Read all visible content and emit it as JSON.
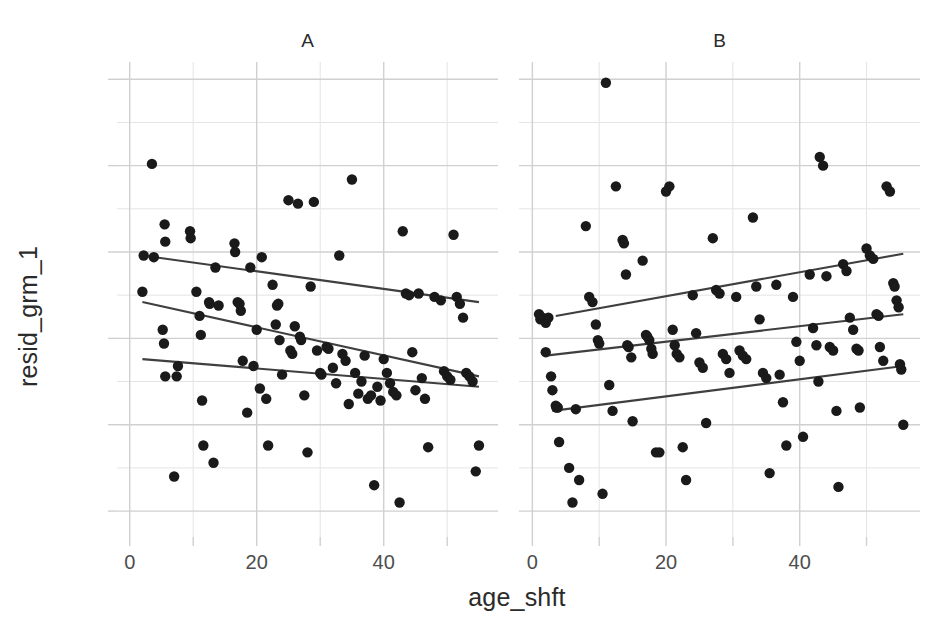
{
  "chart_data": {
    "type": "scatter",
    "title": "",
    "xlabel": "age_shft",
    "ylabel": "resid_grm_1",
    "xlim": [
      -2,
      58
    ],
    "ylim": [
      -115,
      160
    ],
    "grid": true,
    "legend_position": "none",
    "x_major_ticks": [
      0,
      20,
      40
    ],
    "x_major_tick_labels": [
      "0",
      "20",
      "40"
    ],
    "x_minor_ticks": [
      10,
      30,
      50
    ],
    "y_major_ticks": [
      -100,
      -50,
      0,
      50,
      100,
      150
    ],
    "y_major_tick_labels": [
      "-100",
      "-50",
      "0",
      "50",
      "100",
      "150"
    ],
    "y_minor_ticks": [
      -75,
      -25,
      25,
      75,
      125
    ],
    "panels": [
      {
        "label": "A",
        "points": [
          [
            3.5,
            101
          ],
          [
            2.2,
            48
          ],
          [
            3.8,
            47
          ],
          [
            2.0,
            27
          ],
          [
            5.5,
            66
          ],
          [
            5.6,
            56
          ],
          [
            5.2,
            5
          ],
          [
            5.4,
            -3
          ],
          [
            5.6,
            -22
          ],
          [
            7.0,
            -80
          ],
          [
            7.4,
            -22
          ],
          [
            7.6,
            -16
          ],
          [
            9.5,
            62
          ],
          [
            9.6,
            58
          ],
          [
            10.5,
            27
          ],
          [
            11.0,
            13
          ],
          [
            11.2,
            2
          ],
          [
            11.4,
            -36
          ],
          [
            11.6,
            -62
          ],
          [
            12.5,
            21
          ],
          [
            12.6,
            20
          ],
          [
            13.2,
            -72
          ],
          [
            13.5,
            41
          ],
          [
            14.0,
            19
          ],
          [
            16.5,
            55
          ],
          [
            16.6,
            50
          ],
          [
            17.0,
            21
          ],
          [
            17.3,
            20
          ],
          [
            17.5,
            16
          ],
          [
            17.8,
            -13
          ],
          [
            18.5,
            -43
          ],
          [
            19.0,
            41
          ],
          [
            19.5,
            -16
          ],
          [
            20.0,
            5
          ],
          [
            20.5,
            -29
          ],
          [
            20.8,
            47
          ],
          [
            21.5,
            -35
          ],
          [
            21.8,
            -62
          ],
          [
            22.5,
            31
          ],
          [
            23.0,
            8
          ],
          [
            23.2,
            19
          ],
          [
            23.4,
            20
          ],
          [
            23.6,
            -1
          ],
          [
            24.0,
            -21
          ],
          [
            25.0,
            80
          ],
          [
            25.3,
            -7
          ],
          [
            25.6,
            -9
          ],
          [
            26.0,
            7
          ],
          [
            26.5,
            78
          ],
          [
            26.8,
            1
          ],
          [
            27.0,
            -1
          ],
          [
            27.5,
            -33
          ],
          [
            28.0,
            -66
          ],
          [
            28.5,
            30
          ],
          [
            29.0,
            79
          ],
          [
            29.5,
            -7
          ],
          [
            30.0,
            -20
          ],
          [
            30.2,
            -21
          ],
          [
            31.0,
            -5
          ],
          [
            31.3,
            -6
          ],
          [
            32.0,
            -17
          ],
          [
            32.5,
            -26
          ],
          [
            33.0,
            48
          ],
          [
            33.5,
            -9
          ],
          [
            34.0,
            -13
          ],
          [
            34.5,
            -38
          ],
          [
            35.0,
            92
          ],
          [
            35.5,
            -20
          ],
          [
            36.0,
            -32
          ],
          [
            36.5,
            -25
          ],
          [
            37.0,
            -10
          ],
          [
            37.5,
            -35
          ],
          [
            38.0,
            -33
          ],
          [
            38.5,
            -85
          ],
          [
            39.0,
            -28
          ],
          [
            39.5,
            -36
          ],
          [
            40.0,
            -12
          ],
          [
            40.5,
            -20
          ],
          [
            41.0,
            -26
          ],
          [
            41.5,
            -31
          ],
          [
            42.0,
            -33
          ],
          [
            42.5,
            -95
          ],
          [
            43.0,
            62
          ],
          [
            43.5,
            26
          ],
          [
            44.0,
            25
          ],
          [
            44.5,
            -8
          ],
          [
            45.0,
            -30
          ],
          [
            45.5,
            26
          ],
          [
            46.0,
            -23
          ],
          [
            46.5,
            -35
          ],
          [
            47.0,
            -63
          ],
          [
            48.0,
            24
          ],
          [
            49.0,
            22
          ],
          [
            49.5,
            -19
          ],
          [
            50.0,
            -22
          ],
          [
            50.5,
            -24
          ],
          [
            51.0,
            60
          ],
          [
            51.5,
            24
          ],
          [
            52.0,
            20
          ],
          [
            52.5,
            12
          ],
          [
            53.0,
            -20
          ],
          [
            53.5,
            -22
          ],
          [
            54.0,
            -25
          ],
          [
            54.5,
            -77
          ],
          [
            55.0,
            -62
          ]
        ],
        "fit_lines": [
          {
            "quantile": "upper",
            "x0": 2.0,
            "y0": 48,
            "x1": 55.0,
            "y1": 21
          },
          {
            "quantile": "median",
            "x0": 2.0,
            "y0": 21,
            "x1": 55.0,
            "y1": -22
          },
          {
            "quantile": "lower",
            "x0": 2.0,
            "y0": -12,
            "x1": 55.0,
            "y1": -28
          }
        ]
      },
      {
        "label": "B",
        "points": [
          [
            1.0,
            14
          ],
          [
            1.2,
            11
          ],
          [
            1.5,
            12
          ],
          [
            2.0,
            9
          ],
          [
            2.4,
            12
          ],
          [
            2.0,
            -8
          ],
          [
            2.8,
            -22
          ],
          [
            3.0,
            -30
          ],
          [
            3.5,
            -39
          ],
          [
            3.6,
            -40
          ],
          [
            3.8,
            -40
          ],
          [
            4.0,
            -60
          ],
          [
            5.5,
            -75
          ],
          [
            6.0,
            -95
          ],
          [
            6.5,
            -41
          ],
          [
            7.0,
            -82
          ],
          [
            8.0,
            65
          ],
          [
            8.5,
            24
          ],
          [
            9.0,
            21
          ],
          [
            9.5,
            8
          ],
          [
            9.8,
            -1
          ],
          [
            10.0,
            -3
          ],
          [
            10.5,
            -90
          ],
          [
            11.0,
            148
          ],
          [
            11.5,
            -27
          ],
          [
            12.0,
            -42
          ],
          [
            12.5,
            88
          ],
          [
            13.5,
            57
          ],
          [
            13.7,
            55
          ],
          [
            14.0,
            37
          ],
          [
            14.2,
            -4
          ],
          [
            14.4,
            -5
          ],
          [
            14.8,
            -11
          ],
          [
            15.0,
            -48
          ],
          [
            16.5,
            45
          ],
          [
            17.0,
            2
          ],
          [
            17.2,
            1
          ],
          [
            17.5,
            -1
          ],
          [
            17.8,
            -6
          ],
          [
            18.0,
            -9
          ],
          [
            18.5,
            -66
          ],
          [
            19.0,
            -66
          ],
          [
            20.0,
            85
          ],
          [
            20.5,
            88
          ],
          [
            21.0,
            5
          ],
          [
            21.3,
            -4
          ],
          [
            21.6,
            -9
          ],
          [
            22.0,
            -11
          ],
          [
            22.5,
            -63
          ],
          [
            23.0,
            -82
          ],
          [
            24.0,
            25
          ],
          [
            24.5,
            3
          ],
          [
            25.0,
            -14
          ],
          [
            25.5,
            -17
          ],
          [
            26.0,
            -49
          ],
          [
            27.0,
            58
          ],
          [
            27.5,
            28
          ],
          [
            28.0,
            26
          ],
          [
            28.5,
            -9
          ],
          [
            29.0,
            -12
          ],
          [
            29.5,
            -20
          ],
          [
            30.5,
            24
          ],
          [
            31.0,
            -7
          ],
          [
            31.5,
            -10
          ],
          [
            32.0,
            -12
          ],
          [
            33.0,
            70
          ],
          [
            33.5,
            30
          ],
          [
            34.0,
            11
          ],
          [
            34.5,
            -20
          ],
          [
            35.0,
            -23
          ],
          [
            35.5,
            -78
          ],
          [
            36.5,
            31
          ],
          [
            37.0,
            -21
          ],
          [
            37.5,
            -37
          ],
          [
            38.0,
            -62
          ],
          [
            39.0,
            24
          ],
          [
            39.5,
            -2
          ],
          [
            40.0,
            -13
          ],
          [
            40.5,
            -57
          ],
          [
            41.5,
            37
          ],
          [
            42.0,
            6
          ],
          [
            42.5,
            -4
          ],
          [
            42.8,
            -25
          ],
          [
            43.0,
            105
          ],
          [
            43.5,
            100
          ],
          [
            44.0,
            36
          ],
          [
            44.5,
            -5
          ],
          [
            45.0,
            -7
          ],
          [
            45.5,
            -42
          ],
          [
            45.8,
            -86
          ],
          [
            46.5,
            43
          ],
          [
            47.0,
            39
          ],
          [
            47.5,
            12
          ],
          [
            48.0,
            5
          ],
          [
            48.5,
            -6
          ],
          [
            48.8,
            -7
          ],
          [
            49.0,
            -40
          ],
          [
            50.0,
            52
          ],
          [
            50.5,
            48
          ],
          [
            51.0,
            46
          ],
          [
            51.5,
            14
          ],
          [
            51.8,
            13
          ],
          [
            52.0,
            -5
          ],
          [
            52.5,
            -13
          ],
          [
            53.0,
            88
          ],
          [
            53.5,
            85
          ],
          [
            54.0,
            32
          ],
          [
            54.2,
            30
          ],
          [
            54.5,
            22
          ],
          [
            54.8,
            18
          ],
          [
            55.0,
            -15
          ],
          [
            55.2,
            -18
          ],
          [
            55.5,
            -50
          ]
        ],
        "fit_lines": [
          {
            "quantile": "upper",
            "x0": 3.5,
            "y0": 13,
            "x1": 55.5,
            "y1": 49
          },
          {
            "quantile": "median",
            "x0": 2.0,
            "y0": -10,
            "x1": 55.5,
            "y1": 14
          },
          {
            "quantile": "lower",
            "x0": 3.0,
            "y0": -42,
            "x1": 55.5,
            "y1": -16
          }
        ]
      }
    ],
    "style": {
      "point_color": "#1a1a1a",
      "line_color": "#3f3f3f",
      "grid_major_color": "#d0d0d0",
      "grid_minor_color": "#e4e4e4",
      "axis_text_color": "#4d4d4d",
      "background": "#ffffff",
      "point_radius": 5.2
    }
  }
}
